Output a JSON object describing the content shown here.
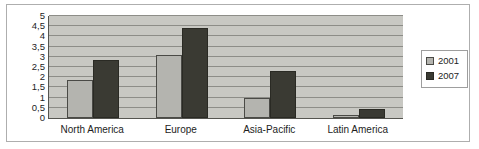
{
  "chart_data": {
    "type": "bar",
    "title": "",
    "subtitle": "",
    "xlabel": "",
    "ylabel": "",
    "ylim": [
      0,
      5
    ],
    "ytick_labels": [
      "5",
      "4,5",
      "4",
      "3,5",
      "3",
      "2,5",
      "2",
      "1,5",
      "1",
      "0,5",
      "0"
    ],
    "ytick_values": [
      5,
      4.5,
      4,
      3.5,
      3,
      2.5,
      2,
      1.5,
      1,
      0.5,
      0
    ],
    "grid": true,
    "legend_position": "right",
    "categories": [
      "North America",
      "Europe",
      "Asia-Pacific",
      "Latin America"
    ],
    "series": [
      {
        "name": "2001",
        "color": "#b4b4af",
        "values": [
          1.85,
          3.1,
          1.0,
          0.15
        ]
      },
      {
        "name": "2007",
        "color": "#3a3a33",
        "values": [
          2.85,
          4.4,
          2.3,
          0.45
        ]
      }
    ]
  }
}
